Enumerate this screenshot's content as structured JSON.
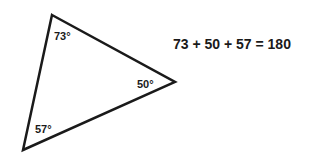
{
  "triangle": {
    "angles": [
      {
        "vertex": "top",
        "label": "73°"
      },
      {
        "vertex": "right",
        "label": "50°"
      },
      {
        "vertex": "bottom-left",
        "label": "57°"
      }
    ],
    "stroke_color": "#1a1a1a"
  },
  "equation": "73 + 50 + 57 = 180"
}
